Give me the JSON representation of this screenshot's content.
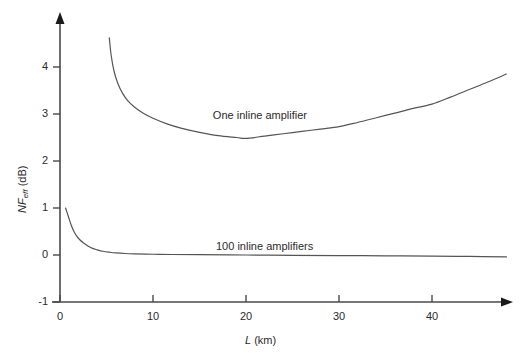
{
  "chart_data": {
    "type": "line",
    "title": "",
    "xlabel": "L (km)",
    "ylabel": "NF_eff (dB)",
    "ylabel_main": "NF",
    "ylabel_sub": "eff",
    "ylabel_unit": " (dB)",
    "xlabel_main": "L",
    "xlabel_unit": " (km)",
    "xlim": [
      0,
      48
    ],
    "ylim": [
      -1,
      4.7
    ],
    "xticks": [
      0,
      10,
      20,
      30,
      40
    ],
    "xtick_labels": [
      "0",
      "10",
      "20",
      "30",
      "40"
    ],
    "yticks": [
      -1,
      0,
      1,
      2,
      3,
      4
    ],
    "ytick_labels": [
      "-1",
      "0",
      "1",
      "2",
      "3",
      "4"
    ],
    "grid": false,
    "legend_position": "inline-annotations",
    "line_color": "#555555",
    "axis_color": "#4a4a4a",
    "series": [
      {
        "name": "One inline amplifier",
        "label": "One inline amplifier",
        "label_x": 21.5,
        "label_y": 2.95,
        "x": [
          5.3,
          5.5,
          5.8,
          6.2,
          6.7,
          7.3,
          8.0,
          9.0,
          10.0,
          11.5,
          13.0,
          15.0,
          17.0,
          19.0,
          20.0,
          22.0,
          24.0,
          26.0,
          28.0,
          30.0,
          32.0,
          34.0,
          36.0,
          38.0,
          40.0,
          42.0,
          44.0,
          46.0,
          48.0
        ],
        "y": [
          4.62,
          4.25,
          3.92,
          3.66,
          3.45,
          3.28,
          3.15,
          3.01,
          2.91,
          2.79,
          2.7,
          2.61,
          2.54,
          2.5,
          2.48,
          2.53,
          2.58,
          2.63,
          2.68,
          2.73,
          2.82,
          2.92,
          3.02,
          3.12,
          3.21,
          3.36,
          3.52,
          3.68,
          3.85
        ]
      },
      {
        "name": "100 inline amplifiers",
        "label": "100 inline amplifiers",
        "label_x": 22.0,
        "label_y": 0.18,
        "x": [
          0.6,
          0.9,
          1.2,
          1.5,
          1.8,
          2.1,
          2.5,
          3.0,
          3.5,
          4.0,
          4.6,
          5.3,
          6.0,
          7.0,
          8.0,
          10.0,
          12.0,
          15.0,
          20.0,
          25.0,
          30.0,
          35.0,
          40.0,
          44.0,
          48.0
        ],
        "y": [
          1.0,
          0.82,
          0.64,
          0.5,
          0.4,
          0.33,
          0.26,
          0.19,
          0.14,
          0.11,
          0.08,
          0.06,
          0.045,
          0.032,
          0.025,
          0.016,
          0.011,
          0.006,
          0.0,
          -0.006,
          -0.012,
          -0.018,
          -0.024,
          -0.03,
          -0.04
        ]
      }
    ]
  }
}
